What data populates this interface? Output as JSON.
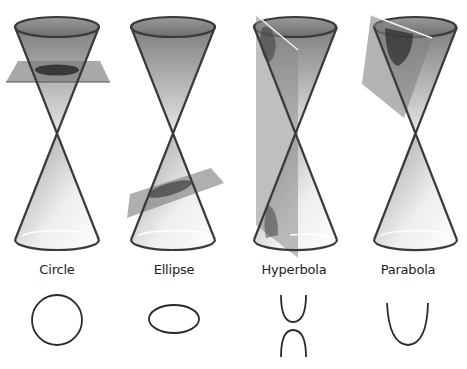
{
  "diagram": {
    "colors": {
      "outline": "#3a3a3a",
      "cone_fill_dark": "#8a8a8a",
      "cone_fill_light": "#f4f4f4",
      "plane_fill": "#7c7c7c",
      "section_fill": "#2e2e2e",
      "background": "#ffffff"
    },
    "panels": [
      {
        "id": "circle",
        "label": "Circle",
        "plane": "horizontal",
        "curve": "circle"
      },
      {
        "id": "ellipse",
        "label": "Ellipse",
        "plane": "tilted",
        "curve": "ellipse"
      },
      {
        "id": "hyperbola",
        "label": "Hyperbola",
        "plane": "vertical",
        "curve": "hyperbola"
      },
      {
        "id": "parabola",
        "label": "Parabola",
        "plane": "parallel-to-side",
        "curve": "parabola"
      }
    ]
  }
}
